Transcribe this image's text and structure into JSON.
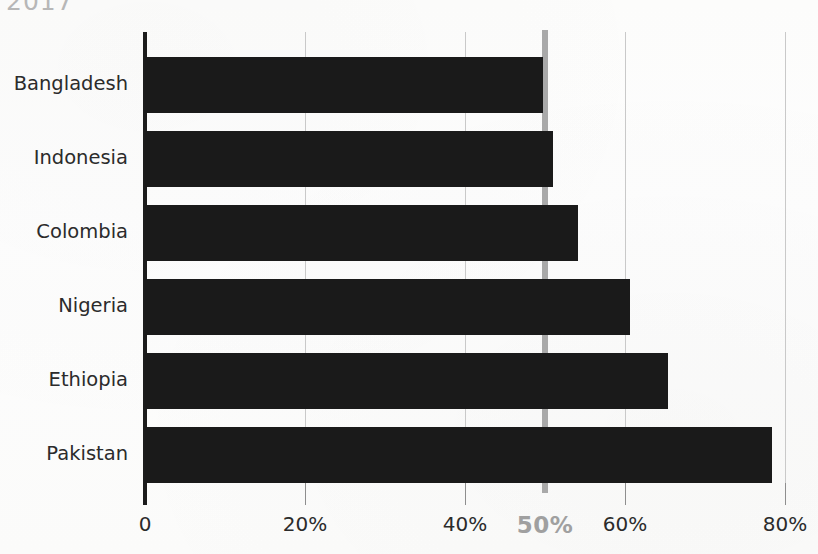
{
  "caption": {
    "clipped_top_text": "2017"
  },
  "chart_data": {
    "type": "bar",
    "orientation": "horizontal",
    "title": "",
    "subtitle": "",
    "xlabel": "",
    "ylabel": "",
    "categories": [
      "Bangladesh",
      "Indonesia",
      "Colombia",
      "Nigeria",
      "Ethiopia",
      "Pakistan"
    ],
    "values": [
      49.8,
      51.0,
      54.1,
      60.6,
      65.4,
      78.4
    ],
    "series": [
      {
        "name": "",
        "values": [
          49.8,
          51.0,
          54.1,
          60.6,
          65.4,
          78.4
        ]
      }
    ],
    "xlim": [
      0,
      82
    ],
    "ylim": [
      0,
      6
    ],
    "xticks": [
      0,
      20,
      40,
      50,
      60,
      80
    ],
    "xtick_labels": [
      "0",
      "20%",
      "40%",
      "50%",
      "60%",
      "80%"
    ],
    "grid": true,
    "grid_axis": "x",
    "legend": false,
    "legend_position": "none",
    "bar_color": "#1a1a1a",
    "grid_color": "#c9c9c9",
    "background_color": "#fdfdfc",
    "annotations": [
      {
        "name": "fifty-percent-reference",
        "type": "vline",
        "value": 50,
        "label": "50%",
        "color": "#a9a9a9",
        "emphasis": "bold"
      }
    ]
  },
  "axis": {
    "y_axis_color": "#1c1c1c",
    "tick_color": "#8e8e8e"
  }
}
